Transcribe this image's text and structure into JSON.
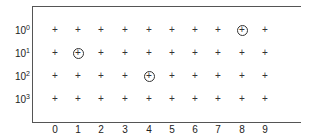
{
  "chart_data": {
    "type": "scatter",
    "title": "",
    "xlabel": "",
    "ylabel": "",
    "x_ticks": [
      "0",
      "1",
      "2",
      "3",
      "4",
      "5",
      "6",
      "7",
      "8",
      "9"
    ],
    "y_ticks": [
      {
        "base": "10",
        "exp": "0"
      },
      {
        "base": "10",
        "exp": "1"
      },
      {
        "base": "10",
        "exp": "2"
      },
      {
        "base": "10",
        "exp": "3"
      }
    ],
    "grid_marker": "+",
    "grid_points": "all combinations of x in 0..9 and y in 10^0..10^3",
    "highlighted_points": [
      {
        "x": 8,
        "y": "10^0"
      },
      {
        "x": 1,
        "y": "10^1"
      },
      {
        "x": 4,
        "y": "10^2"
      }
    ],
    "highlight_marker": "circled +",
    "grid": false,
    "legend": null
  },
  "layout": {
    "x_positions": [
      55,
      78,
      101,
      125,
      149,
      172,
      195,
      218,
      242,
      265
    ],
    "y_positions": [
      30,
      53,
      76,
      99
    ]
  }
}
